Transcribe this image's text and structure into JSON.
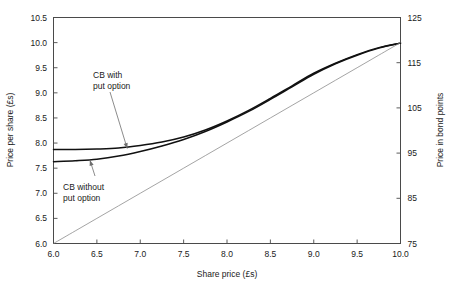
{
  "chart_data": {
    "type": "line",
    "title": "",
    "xlabel": "Share price (£s)",
    "ylabel": "Price per share (£s)",
    "y2label": "Price in bond points",
    "xlim": [
      6.0,
      10.0
    ],
    "ylim": [
      6.0,
      10.5
    ],
    "y2lim": [
      75,
      125
    ],
    "grid": false,
    "legend": "none",
    "xticks": [
      "6.0",
      "6.5",
      "7.0",
      "7.5",
      "8.0",
      "8.5",
      "9.0",
      "9.5",
      "10.0"
    ],
    "xtick_values": [
      6.0,
      6.5,
      7.0,
      7.5,
      8.0,
      8.5,
      9.0,
      9.5,
      10.0
    ],
    "yticks": [
      "6.0",
      "6.5",
      "7.0",
      "7.5",
      "8.0",
      "8.5",
      "9.0",
      "9.5",
      "10.0",
      "10.5"
    ],
    "ytick_values": [
      6.0,
      6.5,
      7.0,
      7.5,
      8.0,
      8.5,
      9.0,
      9.5,
      10.0,
      10.5
    ],
    "y2ticks": [
      "75",
      "85",
      "95",
      "105",
      "115",
      "125"
    ],
    "y2tick_values": [
      75,
      85,
      95,
      105,
      115,
      125
    ],
    "x": [
      6.0,
      6.25,
      6.5,
      6.75,
      7.0,
      7.25,
      7.5,
      7.75,
      8.0,
      8.25,
      8.5,
      8.75,
      9.0,
      9.25,
      9.5,
      9.75,
      10.0
    ],
    "series": [
      {
        "name": "CB with put option",
        "style": "thick",
        "values": [
          7.87,
          7.87,
          7.88,
          7.9,
          7.95,
          8.02,
          8.12,
          8.26,
          8.44,
          8.65,
          8.89,
          9.14,
          9.39,
          9.59,
          9.76,
          9.9,
          9.99
        ]
      },
      {
        "name": "CB without put option",
        "style": "thick",
        "values": [
          7.63,
          7.65,
          7.68,
          7.74,
          7.83,
          7.94,
          8.07,
          8.23,
          8.42,
          8.63,
          8.87,
          9.12,
          9.37,
          9.58,
          9.75,
          9.89,
          9.99
        ]
      },
      {
        "name": "Parity",
        "style": "thin",
        "values": [
          6.0,
          6.25,
          6.5,
          6.75,
          7.0,
          7.25,
          7.5,
          7.75,
          8.0,
          8.25,
          8.5,
          8.75,
          9.0,
          9.25,
          9.5,
          9.75,
          10.0
        ]
      }
    ],
    "annotations": [
      {
        "label_line1": "CB with",
        "label_line2": "put option",
        "target_x": 6.85,
        "target_y": 7.89
      },
      {
        "label_line1": "CB without",
        "label_line2": "put option",
        "target_x": 6.42,
        "target_y": 7.66
      }
    ]
  }
}
